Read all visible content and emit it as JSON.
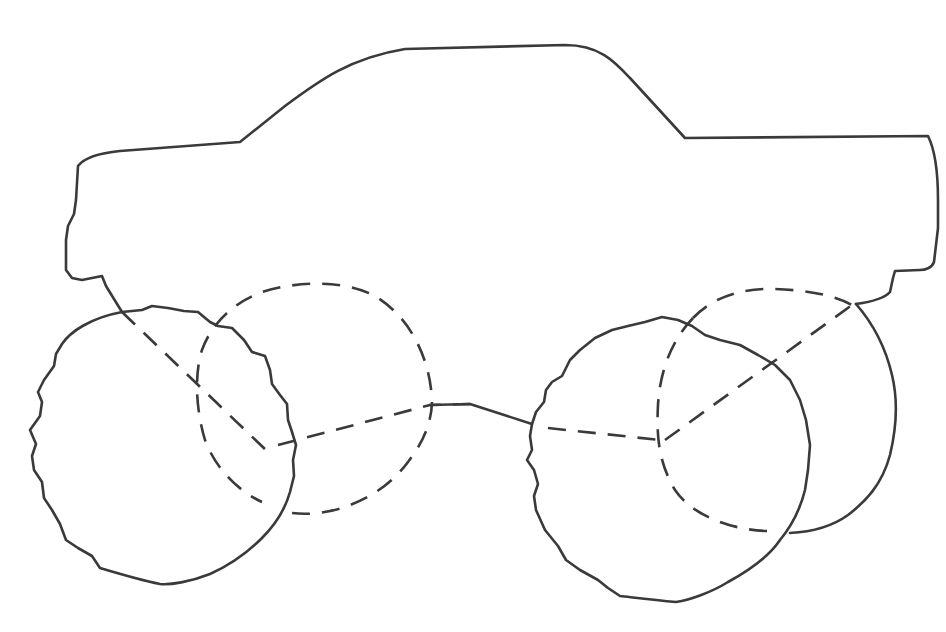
{
  "figure": {
    "colors": {
      "background": "#ffffff",
      "line": "#3a3a3a"
    },
    "parts": [
      {
        "id": "truck-body",
        "style": "solid",
        "label": "Pickup truck body outline"
      },
      {
        "id": "front-wheel-near",
        "style": "solid",
        "label": "Front near tire (wavy edge)"
      },
      {
        "id": "front-wheel-far",
        "style": "dashed",
        "label": "Front far tire (hidden)"
      },
      {
        "id": "rear-wheel-near",
        "style": "solid",
        "label": "Rear near tire (wavy edge)"
      },
      {
        "id": "rear-wheel-far",
        "style": "dashed",
        "label": "Rear far tire (hidden)"
      },
      {
        "id": "axle-lines",
        "style": "dashed",
        "label": "Hidden axle / suspension lines"
      }
    ]
  }
}
